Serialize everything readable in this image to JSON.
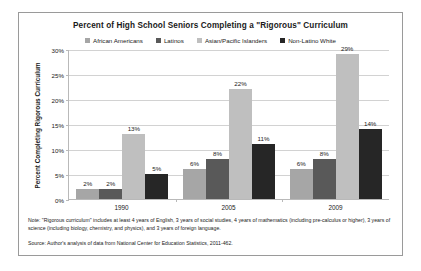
{
  "chart_data": {
    "type": "bar",
    "title": "Percent of High School Seniors Completing a \"Rigorous\" Curriculum",
    "xlabel": "",
    "ylabel": "Percent Completing Rigorous Curriculum",
    "ylim": [
      0,
      30
    ],
    "ytick_labels": [
      "0%",
      "5%",
      "10%",
      "15%",
      "20%",
      "25%",
      "30%"
    ],
    "ytick_values": [
      0,
      5,
      10,
      15,
      20,
      25,
      30
    ],
    "grid": true,
    "legend_position": "top",
    "categories": [
      "1990",
      "2005",
      "2009"
    ],
    "series": [
      {
        "name": "African Americans",
        "color": "#a6a6a6",
        "values": [
          2,
          6,
          6
        ],
        "labels": [
          "2%",
          "6%",
          "6%"
        ]
      },
      {
        "name": "Latinos",
        "color": "#595959",
        "values": [
          2,
          8,
          8
        ],
        "labels": [
          "2%",
          "8%",
          "8%"
        ]
      },
      {
        "name": "Asian/Pacific Islanders",
        "color": "#bfbfbf",
        "values": [
          13,
          22,
          29
        ],
        "labels": [
          "13%",
          "22%",
          "29%"
        ]
      },
      {
        "name": "Non-Latino White",
        "color": "#262626",
        "values": [
          5,
          11,
          14
        ],
        "labels": [
          "5%",
          "11%",
          "14%"
        ]
      }
    ],
    "note": "Note: \"Rigorous curriculum\" includes at least 4 years of English, 3 years of social studies, 4 years of mathematics (including pre-calculus or higher), 3 years of science (including biology, chemistry, and physics), and 3 years of foreign language.",
    "source": "Source: Author's analysis of data from National Center for Education Statistics, 2011-462."
  }
}
